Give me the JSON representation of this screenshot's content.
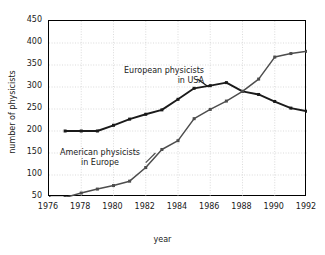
{
  "chart_data": {
    "type": "line",
    "title": "",
    "xlabel": "year",
    "ylabel": "number of physicists",
    "xlim": [
      1976,
      1992
    ],
    "ylim": [
      0,
      450
    ],
    "grid": true,
    "legend_position": "inline-annotations",
    "xticks": [
      1976,
      1978,
      1980,
      1982,
      1984,
      1986,
      1988,
      1990,
      1992
    ],
    "yticks": [
      50,
      100,
      150,
      200,
      250,
      300,
      350,
      400,
      450
    ],
    "series": [
      {
        "name": "European physicists in USA",
        "color": "#1a1a1a",
        "annotation_line1": "European physicists",
        "annotation_line2": "in USA",
        "x": [
          1977,
          1978,
          1979,
          1980,
          1981,
          1982,
          1983,
          1984,
          1985,
          1986,
          1987,
          1988,
          1989,
          1990,
          1991,
          1992
        ],
        "values": [
          200,
          200,
          200,
          213,
          227,
          238,
          248,
          272,
          297,
          303,
          310,
          290,
          283,
          267,
          252,
          245
        ]
      },
      {
        "name": "American physicists in Europe",
        "color": "#4d4d4d",
        "annotation_line1": "American physicists",
        "annotation_line2": "in Europe",
        "x": [
          1976,
          1977,
          1978,
          1979,
          1980,
          1981,
          1982,
          1983,
          1984,
          1985,
          1986,
          1987,
          1988,
          1989,
          1990,
          1991,
          1992
        ],
        "values": [
          49,
          49,
          59,
          68,
          76,
          86,
          117,
          158,
          178,
          228,
          249,
          268,
          290,
          318,
          368,
          376,
          381
        ]
      }
    ]
  },
  "axis": {
    "ytick_labels": [
      "450",
      "400",
      "350",
      "300",
      "250",
      "200",
      "150",
      "100",
      "50"
    ],
    "xtick_labels": [
      "1976",
      "1978",
      "1980",
      "1982",
      "1984",
      "1986",
      "1988",
      "1990",
      "1992"
    ],
    "xlabel": "year",
    "ylabel": "number of physicists"
  },
  "annotations": {
    "european_l1": "European physicists",
    "european_l2": "in USA",
    "american_l1": "American physicists",
    "american_l2": "in Europe"
  },
  "colors": {
    "series_european": "#1a1a1a",
    "series_american": "#4d4d4d",
    "grid": "#cccccc",
    "axis": "#000000",
    "background": "#ffffff"
  }
}
